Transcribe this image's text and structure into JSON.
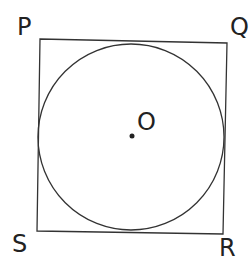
{
  "diagram": {
    "labels": {
      "P": "P",
      "Q": "Q",
      "R": "R",
      "S": "S",
      "O": "O"
    },
    "square": {
      "P": [
        40,
        39
      ],
      "Q": [
        227,
        43
      ],
      "R": [
        223,
        234
      ],
      "S": [
        37,
        231
      ]
    },
    "circle": {
      "cx": 131,
      "cy": 137,
      "r": 93
    },
    "center_point": [
      132,
      136
    ],
    "stroke_color": "#333333"
  }
}
